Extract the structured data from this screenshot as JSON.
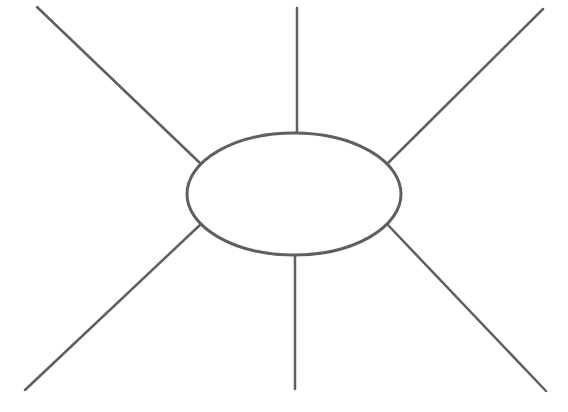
{
  "diagram": {
    "type": "spider-map",
    "stroke_color": "#5f5f5f",
    "background": "#ffffff",
    "stroke_width": 2.5,
    "center": {
      "shape": "ellipse",
      "cx": 294,
      "cy": 194,
      "rx": 107,
      "ry": 61,
      "label": ""
    },
    "spokes": [
      {
        "name": "spoke-top-left",
        "x1": 37,
        "y1": 7,
        "x2": 201,
        "y2": 164
      },
      {
        "name": "spoke-top",
        "x1": 297,
        "y1": 8,
        "x2": 297,
        "y2": 133
      },
      {
        "name": "spoke-top-right",
        "x1": 543,
        "y1": 9,
        "x2": 387,
        "y2": 164
      },
      {
        "name": "spoke-bottom-left",
        "x1": 25,
        "y1": 390,
        "x2": 201,
        "y2": 224
      },
      {
        "name": "spoke-bottom",
        "x1": 295,
        "y1": 255,
        "x2": 295,
        "y2": 389
      },
      {
        "name": "spoke-bottom-right",
        "x1": 546,
        "y1": 391,
        "x2": 387,
        "y2": 224
      }
    ]
  }
}
